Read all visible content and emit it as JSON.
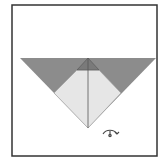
{
  "diagram": {
    "type": "origami-step",
    "frame": {
      "x": 12,
      "y": 5,
      "width": 145,
      "height": 151,
      "stroke": "#333333",
      "stroke_width": 1.5
    },
    "colors": {
      "background": "#ffffff",
      "paper_back": "#8c8c8c",
      "paper_front": "#e6e6e6",
      "cap": "#7a7a7a",
      "line": "#555555"
    },
    "shapes": {
      "outer_triangle": "20,58 156,58 88,128",
      "inner_front": "54,93 77,70 99,70 121,93 88,128",
      "cap_triangle": "88,58 77,70 99,70",
      "center_crease": {
        "x1": 88,
        "y1": 58,
        "x2": 88,
        "y2": 128
      }
    },
    "symbols": [
      {
        "name": "turn-over-symbol",
        "meaning": "turn over",
        "x": 103,
        "y": 129
      }
    ]
  }
}
